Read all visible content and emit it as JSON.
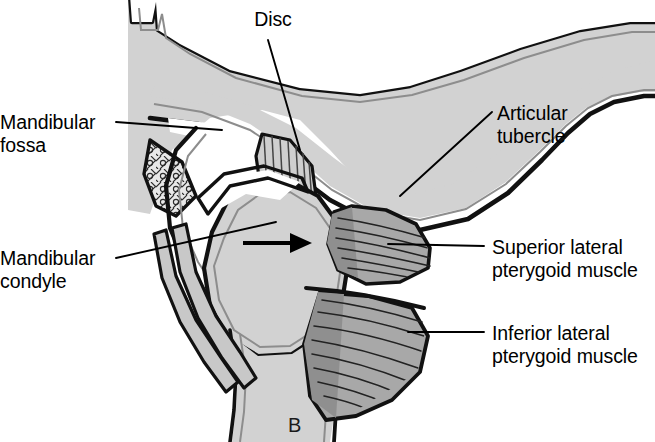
{
  "figure": {
    "panel_letter": "B",
    "background_color": "#ffffff",
    "line_color": "#000000",
    "bone_fill": "#d2d2d2",
    "bone_fill_light": "#dcdcdc",
    "muscle_fill": "#a8a8a8",
    "muscle_fill_dark": "#8f8f8f",
    "disc_fill": "#cfcfcf",
    "cavity_fill": "#ffffff"
  },
  "labels": {
    "disc": "Disc",
    "mandibular_fossa_line1": "Mandibular",
    "mandibular_fossa_line2": "fossa",
    "mandibular_condyle_line1": "Mandibular",
    "mandibular_condyle_line2": "condyle",
    "articular_tubercle_line1": "Articular",
    "articular_tubercle_line2": "tubercle",
    "superior_lateral_pterygoid_line1": "Superior lateral",
    "superior_lateral_pterygoid_line2": "pterygoid muscle",
    "inferior_lateral_pterygoid_line1": "Inferior lateral",
    "inferior_lateral_pterygoid_line2": "pterygoid muscle"
  },
  "annotations": {
    "translation_arrow": "forward-translation-arrow"
  }
}
